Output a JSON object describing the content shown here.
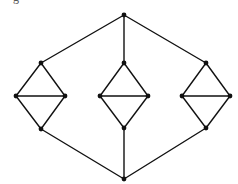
{
  "caption_fragment": "g",
  "graph": {
    "width": 238,
    "height": 184,
    "edge_color": "#111111",
    "node_color": "#111111",
    "node_radius": 2.4,
    "nodes": [
      {
        "id": "top",
        "x": 124,
        "y": 15
      },
      {
        "id": "bottom",
        "x": 124,
        "y": 179
      },
      {
        "id": "L_top",
        "x": 41,
        "y": 63
      },
      {
        "id": "L_left",
        "x": 16,
        "y": 96
      },
      {
        "id": "L_right",
        "x": 65,
        "y": 96
      },
      {
        "id": "L_bottom",
        "x": 41,
        "y": 129
      },
      {
        "id": "M_top",
        "x": 124,
        "y": 63
      },
      {
        "id": "M_left",
        "x": 100,
        "y": 96
      },
      {
        "id": "M_right",
        "x": 148,
        "y": 96
      },
      {
        "id": "M_bottom",
        "x": 124,
        "y": 128
      },
      {
        "id": "R_top",
        "x": 206,
        "y": 63
      },
      {
        "id": "R_left",
        "x": 182,
        "y": 96
      },
      {
        "id": "R_right",
        "x": 230,
        "y": 96
      },
      {
        "id": "R_bottom",
        "x": 206,
        "y": 128
      }
    ],
    "edges": [
      [
        "top",
        "L_top"
      ],
      [
        "top",
        "M_top"
      ],
      [
        "top",
        "R_top"
      ],
      [
        "bottom",
        "L_bottom"
      ],
      [
        "bottom",
        "M_bottom"
      ],
      [
        "bottom",
        "R_bottom"
      ],
      [
        "L_top",
        "L_left"
      ],
      [
        "L_top",
        "L_right"
      ],
      [
        "L_left",
        "L_right"
      ],
      [
        "L_left",
        "L_bottom"
      ],
      [
        "L_right",
        "L_bottom"
      ],
      [
        "M_top",
        "M_left"
      ],
      [
        "M_top",
        "M_right"
      ],
      [
        "M_left",
        "M_right"
      ],
      [
        "M_left",
        "M_bottom"
      ],
      [
        "M_right",
        "M_bottom"
      ],
      [
        "R_top",
        "R_left"
      ],
      [
        "R_top",
        "R_right"
      ],
      [
        "R_left",
        "R_right"
      ],
      [
        "R_left",
        "R_bottom"
      ],
      [
        "R_right",
        "R_bottom"
      ]
    ]
  }
}
